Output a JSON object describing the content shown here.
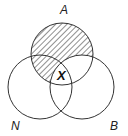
{
  "diagram": {
    "type": "venn-3",
    "sets": [
      {
        "id": "A",
        "label": "A",
        "cx": 62,
        "cy": 54,
        "r": 31
      },
      {
        "id": "N",
        "label": "N",
        "cx": 40,
        "cy": 87,
        "r": 32
      },
      {
        "id": "B",
        "label": "B",
        "cx": 82,
        "cy": 87,
        "r": 32
      }
    ],
    "shaded_region": "A minus B",
    "center_label": "X",
    "stroke_color": "#333333",
    "hatch_color": "#333333"
  }
}
